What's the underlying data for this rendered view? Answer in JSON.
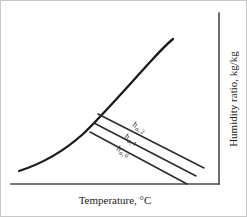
{
  "figure": {
    "kind": "psychrometric-chart",
    "background_color": "#ffffff",
    "border_color": "#c8c8c8",
    "curve_color": "#1a1a1a",
    "axis_color": "#4a4a52",
    "line_color": "#2b2b2b"
  },
  "axes": {
    "x_label": "Temperature, °C",
    "y_label": "Humidity ratio, kg/kg",
    "x_axis_geometry": "M10,183 L218,183",
    "y_axis_geometry": "M218,183 L218,12"
  },
  "chart_data": {
    "type": "line",
    "title": "",
    "xlabel": "Temperature, °C",
    "ylabel": "Humidity ratio, kg/kg",
    "grid": false,
    "legend": "none",
    "axis_ticks": [],
    "saturation_curve": {
      "name": "saturation line (100% RH)",
      "path": "M18,170 C40,163 62,151 82,133 C100,116 128,84 150,60 C160,49 167,42 172,38",
      "stroke_width": 2.3
    },
    "series": [
      {
        "name": "h_a,2",
        "label_main": "h",
        "label_sub": "a, 2",
        "x1": 97,
        "y1": 113,
        "x2": 203,
        "y2": 167,
        "label_x": 131,
        "label_y": 125,
        "label_rotation": 27
      },
      {
        "name": "h_a,1",
        "label_main": "h",
        "label_sub": "a, 1",
        "x1": 93,
        "y1": 122,
        "x2": 195,
        "y2": 175,
        "label_x": 123,
        "label_y": 137,
        "label_rotation": 27
      },
      {
        "name": "h_a,0",
        "label_main": "h",
        "label_sub": "a, 0",
        "x1": 89,
        "y1": 131,
        "x2": 186,
        "y2": 183,
        "label_x": 115,
        "label_y": 149,
        "label_rotation": 27
      }
    ]
  }
}
